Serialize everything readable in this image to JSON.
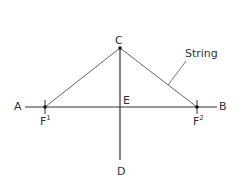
{
  "diagram": {
    "labels": {
      "A": "A",
      "B": "B",
      "C": "C",
      "D": "D",
      "E": "E",
      "F1_base": "F",
      "F1_sup": "1",
      "F2_base": "F",
      "F2_sup": "2",
      "string": "String"
    },
    "colors": {
      "line": "#333333",
      "string": "#555555",
      "text": "#333333"
    }
  }
}
